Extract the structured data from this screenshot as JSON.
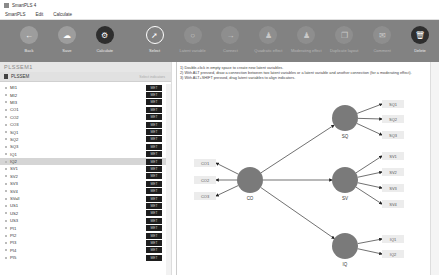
{
  "window": {
    "title": "SmartPLS 4"
  },
  "menu": {
    "items": [
      "SmartPLS",
      "Edit",
      "Calculate"
    ]
  },
  "toolbar": {
    "items": [
      {
        "label": "Back",
        "icon": "arrow-left-icon",
        "style": "normal"
      },
      {
        "label": "Save",
        "icon": "cloud-upload-icon",
        "style": "normal"
      },
      {
        "label": "Calculate",
        "icon": "gear-icon",
        "style": "dark"
      },
      {
        "label": "Select",
        "icon": "cursor-icon",
        "style": "select"
      },
      {
        "label": "Latent variable",
        "icon": "circle-icon",
        "style": "faded"
      },
      {
        "label": "Connect",
        "icon": "arrow-right-icon",
        "style": "faded"
      },
      {
        "label": "Quadratic effect",
        "icon": "person-icon",
        "style": "faded"
      },
      {
        "label": "Moderating effect",
        "icon": "person-icon",
        "style": "faded"
      },
      {
        "label": "Duplicate layout",
        "icon": "duplicate-icon",
        "style": "faded"
      },
      {
        "label": "Comment",
        "icon": "comment-icon",
        "style": "faded"
      },
      {
        "label": "Delete",
        "icon": "trash-icon",
        "style": "dark"
      }
    ]
  },
  "left_panel": {
    "title": "PLSSEM1",
    "project": {
      "name": "PLSSEM",
      "sub": "Select indicators"
    },
    "indicators": [
      {
        "name": "MI1",
        "tag": "MET"
      },
      {
        "name": "MI2",
        "tag": "MET"
      },
      {
        "name": "MI3",
        "tag": "MET"
      },
      {
        "name": "CO1",
        "tag": "MET"
      },
      {
        "name": "CO2",
        "tag": "MET"
      },
      {
        "name": "CO3",
        "tag": "MET"
      },
      {
        "name": "SQ1",
        "tag": "MET"
      },
      {
        "name": "SQ2",
        "tag": "MET"
      },
      {
        "name": "SQ3",
        "tag": "MET"
      },
      {
        "name": "IQ1",
        "tag": "MET"
      },
      {
        "name": "IQ2",
        "tag": "MET",
        "selected": true
      },
      {
        "name": "SV1",
        "tag": "MET"
      },
      {
        "name": "SV2",
        "tag": "MET"
      },
      {
        "name": "SV3",
        "tag": "MET"
      },
      {
        "name": "SV4",
        "tag": "MET"
      },
      {
        "name": "SVall",
        "tag": "MET"
      },
      {
        "name": "US1",
        "tag": "MET"
      },
      {
        "name": "US2",
        "tag": "MET"
      },
      {
        "name": "US3",
        "tag": "MET"
      },
      {
        "name": "PI1",
        "tag": "MET"
      },
      {
        "name": "PI2",
        "tag": "MET"
      },
      {
        "name": "PI3",
        "tag": "MET"
      },
      {
        "name": "PI4",
        "tag": "MET"
      },
      {
        "name": "PI5",
        "tag": "MET"
      }
    ]
  },
  "canvas": {
    "hints": [
      "1) Double-click in empty space to create new latent variables.",
      "2) With ALT pressed, draw a connection between two latent variables or a latent variable and another connection (for a moderating effect).",
      "3) With ALT+SHIFT pressed, drag latent variables to align indicators."
    ],
    "latent_variables": [
      {
        "name": "CO",
        "x": 250,
        "y": 180
      },
      {
        "name": "SQ",
        "x": 345,
        "y": 118
      },
      {
        "name": "SV",
        "x": 345,
        "y": 180
      },
      {
        "name": "IQ",
        "x": 345,
        "y": 246
      }
    ],
    "indicators": [
      {
        "name": "CO1",
        "lv": "CO",
        "x": 205,
        "y": 163
      },
      {
        "name": "CO2",
        "lv": "CO",
        "x": 205,
        "y": 180
      },
      {
        "name": "CO3",
        "lv": "CO",
        "x": 205,
        "y": 196
      },
      {
        "name": "SQ1",
        "lv": "SQ",
        "x": 393,
        "y": 104
      },
      {
        "name": "SQ2",
        "lv": "SQ",
        "x": 393,
        "y": 119
      },
      {
        "name": "SQ3",
        "lv": "SQ",
        "x": 393,
        "y": 135
      },
      {
        "name": "SV1",
        "lv": "SV",
        "x": 393,
        "y": 156
      },
      {
        "name": "SV2",
        "lv": "SV",
        "x": 393,
        "y": 172
      },
      {
        "name": "SV3",
        "lv": "SV",
        "x": 393,
        "y": 188
      },
      {
        "name": "SV4",
        "lv": "SV",
        "x": 393,
        "y": 204
      },
      {
        "name": "IQ1",
        "lv": "IQ",
        "x": 393,
        "y": 239
      },
      {
        "name": "IQ2",
        "lv": "IQ",
        "x": 393,
        "y": 254
      }
    ],
    "paths": [
      {
        "from": "CO",
        "to": "SQ"
      },
      {
        "from": "CO",
        "to": "SV"
      },
      {
        "from": "CO",
        "to": "IQ"
      }
    ]
  }
}
